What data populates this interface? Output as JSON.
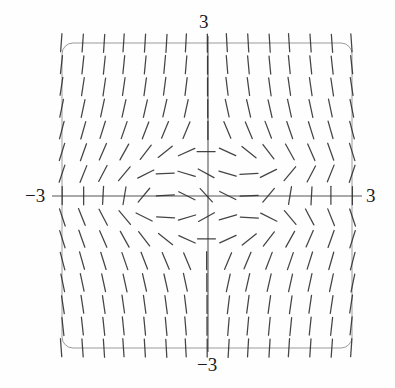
{
  "figure": {
    "kind": "slope-field",
    "title": "",
    "background_color": "#fefefe",
    "ink_color": "#2b2b2b",
    "frame_color": "#9a9a9a",
    "axis_color": "#555555"
  },
  "labels": {
    "top": "3",
    "bottom": "−3",
    "left": "−3",
    "right": "3"
  },
  "chart_data": {
    "type": "scatter",
    "subtype": "slope-field",
    "title": "",
    "xlabel": "",
    "ylabel": "",
    "xlim": [
      -3,
      3
    ],
    "ylim": [
      -3,
      3
    ],
    "xticks": [
      -3,
      3
    ],
    "yticks": [
      -3,
      3
    ],
    "xtick_labels": [
      "−3",
      "3"
    ],
    "ytick_labels": [
      "−3",
      "3"
    ],
    "grid": false,
    "legend": null,
    "axes_drawn": [
      "x-axis at y=0",
      "y-axis at x=0"
    ],
    "frame": "rounded rectangle border",
    "grid_columns": 15,
    "grid_rows": 15,
    "grid_x": [
      -3.0,
      -2.571,
      -2.143,
      -1.714,
      -1.286,
      -0.857,
      -0.429,
      0.0,
      0.429,
      0.857,
      1.286,
      1.714,
      2.143,
      2.571,
      3.0
    ],
    "grid_y": [
      3.0,
      2.571,
      2.143,
      1.714,
      1.286,
      0.857,
      0.429,
      0.0,
      -0.429,
      -0.857,
      -1.286,
      -1.714,
      -2.143,
      -2.571,
      -3.0
    ],
    "slope_formula_description": "dy/dx is large (near vertical) far from the origin and small (near horizontal) close to the origin; segments tilt to the right in the left half and mirror across both axes",
    "segment_length_px": 18,
    "slope_rows": [
      {
        "y": 3.0,
        "slopes": [
          14.0,
          14.0,
          15.0,
          15.0,
          16.0,
          17.0,
          18.0,
          40.0,
          -18.0,
          -17.0,
          -16.0,
          -15.0,
          -15.0,
          -14.0,
          -14.0
        ]
      },
      {
        "y": 2.571,
        "slopes": [
          9.0,
          9.2,
          9.5,
          10.0,
          10.5,
          11.0,
          12.0,
          40.0,
          -12.0,
          -11.0,
          -10.5,
          -10.0,
          -9.5,
          -9.2,
          -9.0
        ]
      },
      {
        "y": 2.143,
        "slopes": [
          6.5,
          6.6,
          6.8,
          7.0,
          7.3,
          7.6,
          8.2,
          40.0,
          -8.2,
          -7.6,
          -7.3,
          -7.0,
          -6.8,
          -6.6,
          -6.5
        ]
      },
      {
        "y": 1.714,
        "slopes": [
          4.8,
          4.7,
          4.6,
          4.5,
          4.4,
          4.4,
          4.6,
          40.0,
          -4.6,
          -4.4,
          -4.4,
          -4.5,
          -4.6,
          -4.7,
          -4.8
        ]
      },
      {
        "y": 1.286,
        "slopes": [
          3.8,
          3.5,
          3.2,
          2.9,
          2.6,
          2.4,
          2.4,
          40.0,
          -2.4,
          -2.4,
          -2.6,
          -2.9,
          -3.2,
          -3.5,
          -3.8
        ]
      },
      {
        "y": 0.857,
        "slopes": [
          3.2,
          2.8,
          2.3,
          1.8,
          1.3,
          0.8,
          0.45,
          0.0,
          -0.45,
          -0.8,
          -1.3,
          -1.8,
          -2.3,
          -2.8,
          -3.2
        ]
      },
      {
        "y": 0.429,
        "slopes": [
          3.0,
          2.5,
          1.9,
          1.2,
          0.5,
          0.05,
          -0.3,
          -0.55,
          -0.3,
          0.05,
          0.5,
          1.2,
          1.9,
          2.5,
          3.0
        ]
      },
      {
        "y": 0.0,
        "slopes": [
          40.0,
          40.0,
          18.0,
          6.0,
          1.2,
          0.05,
          -0.5,
          -1.1,
          -0.5,
          0.05,
          1.2,
          6.0,
          18.0,
          40.0,
          40.0
        ]
      },
      {
        "y": -0.429,
        "slopes": [
          -3.0,
          -2.5,
          -1.9,
          -1.2,
          -0.5,
          -0.05,
          0.3,
          0.55,
          0.3,
          -0.05,
          -0.5,
          -1.2,
          -1.9,
          -2.5,
          -3.0
        ]
      },
      {
        "y": -0.857,
        "slopes": [
          -3.2,
          -2.8,
          -2.3,
          -1.8,
          -1.3,
          -0.8,
          -0.45,
          0.0,
          0.45,
          0.8,
          1.3,
          1.8,
          2.3,
          2.8,
          3.2
        ]
      },
      {
        "y": -1.286,
        "slopes": [
          -3.8,
          -3.5,
          -3.2,
          -2.9,
          -2.6,
          -2.4,
          -2.4,
          40.0,
          2.4,
          2.4,
          2.6,
          2.9,
          3.2,
          3.5,
          3.8
        ]
      },
      {
        "y": -1.714,
        "slopes": [
          -4.8,
          -4.7,
          -4.6,
          -4.5,
          -4.4,
          -4.4,
          -4.6,
          40.0,
          4.6,
          4.4,
          4.4,
          4.5,
          4.6,
          4.7,
          4.8
        ]
      },
      {
        "y": -2.143,
        "slopes": [
          -6.5,
          -6.6,
          -6.8,
          -7.0,
          -7.3,
          -7.6,
          -8.2,
          40.0,
          8.2,
          7.6,
          7.3,
          7.0,
          6.8,
          6.6,
          6.5
        ]
      },
      {
        "y": -2.571,
        "slopes": [
          -9.0,
          -9.2,
          -9.5,
          -10.0,
          -10.5,
          -11.0,
          -12.0,
          40.0,
          12.0,
          11.0,
          10.5,
          10.0,
          9.5,
          9.2,
          9.0
        ]
      },
      {
        "y": -3.0,
        "slopes": [
          -14.0,
          -14.0,
          -15.0,
          -15.0,
          -16.0,
          -17.0,
          -18.0,
          40.0,
          18.0,
          17.0,
          16.0,
          15.0,
          15.0,
          14.0,
          14.0
        ]
      }
    ]
  },
  "geometry": {
    "frame_left": 62,
    "frame_top": 43,
    "frame_right": 352,
    "frame_bottom": 348,
    "corner_radius": 11,
    "origin_x": 208,
    "origin_y": 196,
    "axis_x_left": 52,
    "axis_x_right": 362,
    "axis_y_top": 36,
    "axis_y_bottom": 352
  }
}
